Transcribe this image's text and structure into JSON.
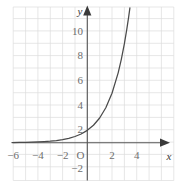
{
  "chart_data": {
    "type": "line",
    "title": "",
    "subtitle": "",
    "xlabel": "x",
    "ylabel": "y",
    "origin_label": "O",
    "xlim": [
      -6.1,
      7.0
    ],
    "ylim": [
      -3.0,
      11.6
    ],
    "grid": true,
    "grid_step": 1,
    "legend": "none",
    "x_ticks": [
      -6,
      -4,
      -2,
      2,
      4
    ],
    "x_tick_labels": [
      "−6",
      "−4",
      "−2",
      "2",
      "4"
    ],
    "y_ticks": [
      10,
      8,
      6,
      4,
      2,
      -2
    ],
    "y_tick_labels": [
      "10",
      "8",
      "6",
      "4",
      "2",
      "−2"
    ],
    "series": [
      {
        "name": "y = 2^x",
        "equation": "y = 2^x",
        "color": "#4a4a4a",
        "x": [
          -6.1,
          -5.5,
          -5,
          -4.5,
          -4,
          -3.5,
          -3,
          -2.5,
          -2,
          -1.5,
          -1,
          -0.5,
          0,
          0.5,
          1,
          1.5,
          2,
          2.5,
          2.75,
          3,
          3.2,
          3.35,
          3.45,
          3.52
        ],
        "values": [
          0.0146,
          0.0221,
          0.0313,
          0.0442,
          0.0625,
          0.0884,
          0.125,
          0.1768,
          0.25,
          0.3536,
          0.5,
          0.7071,
          1,
          1.4142,
          2,
          2.8284,
          4,
          5.6569,
          6.7272,
          8,
          9.1896,
          10.1895,
          10.9221,
          11.4661
        ]
      }
    ],
    "asymptote": {
      "type": "horizontal",
      "value": 0
    },
    "y_intercept": 1
  },
  "style": {
    "grid_color": "#dcdcdc",
    "axis_color": "#555555",
    "curve_color": "#4a4a4a",
    "tick_text_color": "#6e6e6e",
    "background": "#ffffff"
  }
}
